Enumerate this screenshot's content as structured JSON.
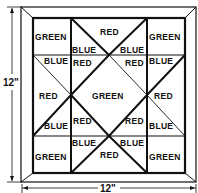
{
  "diagram": {
    "dimensions": {
      "height_label": "12\"",
      "width_label": "12\""
    },
    "colors": {
      "line": "#111111",
      "background": "#ffffff"
    },
    "patches": {
      "top_left": "GREEN",
      "top_right": "GREEN",
      "bottom_left": "GREEN",
      "bottom_right": "GREEN",
      "center": "GREEN",
      "top_middle": "RED",
      "bottom_middle": "RED",
      "left_middle": "RED",
      "right_middle": "RED",
      "top_blue_left": "BLUE",
      "top_blue_right": "BLUE",
      "bottom_blue_left": "BLUE",
      "bottom_blue_right": "BLUE",
      "left_blue_top": "BLUE",
      "left_blue_bottom": "BLUE",
      "right_blue_top": "BLUE",
      "right_blue_bottom": "BLUE",
      "center_red_tl": "RED",
      "center_red_tr": "RED",
      "center_red_bl": "RED",
      "center_red_br": "RED"
    }
  }
}
